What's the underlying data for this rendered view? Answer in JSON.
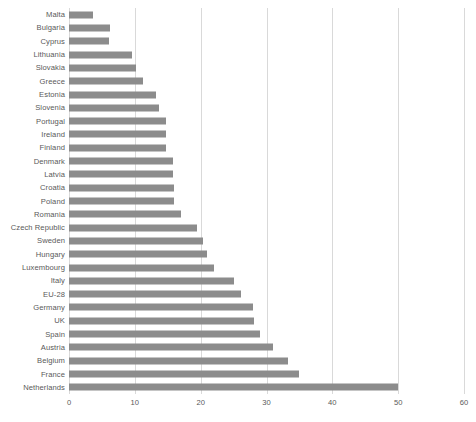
{
  "chart_data": {
    "type": "bar",
    "orientation": "horizontal",
    "title": "",
    "subtitle": "",
    "xlabel": "",
    "ylabel": "",
    "xlim": [
      0,
      60
    ],
    "ylim": null,
    "grid": "vertical",
    "legend": null,
    "legend_position": "none",
    "xticks": [
      "0",
      "10",
      "20",
      "30",
      "40",
      "50",
      "60"
    ],
    "xtick_values": [
      0,
      10,
      20,
      30,
      40,
      50,
      60
    ],
    "bar_color": "#8C8C8C",
    "gridline_color": "#D9D9D9",
    "text_color": "#595959",
    "background_color": "#FFFFFF",
    "categories": [
      "Malta",
      "Bulgaria",
      "Cyprus",
      "Lithuania",
      "Slovakia",
      "Greece",
      "Estonia",
      "Slovenia",
      "Portugal",
      "Ireland",
      "Finland",
      "Denmark",
      "Latvia",
      "Croatia",
      "Poland",
      "Romania",
      "Czech Republic",
      "Sweden",
      "Hungary",
      "Luxembourg",
      "Italy",
      "EU-28",
      "Germany",
      "UK",
      "Spain",
      "Austria",
      "Belgium",
      "France",
      "Netherlands"
    ],
    "values": [
      3.6,
      6.2,
      6.1,
      9.6,
      10.2,
      11.3,
      13.2,
      13.6,
      14.8,
      14.8,
      14.8,
      15.8,
      15.8,
      15.9,
      16.0,
      17.0,
      19.4,
      20.3,
      21.0,
      22.0,
      25.0,
      26.2,
      27.9,
      28.1,
      29.0,
      31.0,
      33.3,
      35.0,
      50.0
    ]
  }
}
